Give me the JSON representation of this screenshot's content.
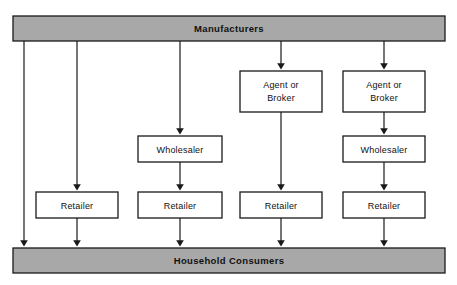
{
  "diagram": {
    "type": "flow-diagram",
    "orientation": "top-to-bottom",
    "canvas": {
      "width": 457,
      "height": 285
    },
    "colors": {
      "bar_fill": "#a8a8a8",
      "box_fill": "#ffffff",
      "stroke": "#1a1a1a",
      "background": "#ffffff"
    },
    "source": {
      "id": "manufacturers",
      "label": "Manufacturers",
      "shape": "bar",
      "x": 13,
      "y": 16,
      "width": 432,
      "height": 25
    },
    "sink": {
      "id": "household-consumers",
      "label": "Household Consumers",
      "shape": "bar",
      "x": 13,
      "y": 248,
      "width": 432,
      "height": 25
    },
    "levels": [
      {
        "id": "agent-level",
        "y": 71,
        "height": 41
      },
      {
        "id": "wholesaler-level",
        "y": 136,
        "height": 26
      },
      {
        "id": "retailer-level",
        "y": 192,
        "height": 26
      }
    ],
    "nodes": [
      {
        "id": "agent-1",
        "label": "Agent or Broker",
        "line1": "Agent or",
        "line2": "Broker",
        "x": 240,
        "y": 71,
        "width": 82,
        "height": 41
      },
      {
        "id": "agent-2",
        "label": "Agent or Broker",
        "line1": "Agent or",
        "line2": "Broker",
        "x": 343,
        "y": 71,
        "width": 82,
        "height": 41
      },
      {
        "id": "wholesaler-1",
        "label": "Wholesaler",
        "x": 138,
        "y": 136,
        "width": 84,
        "height": 26
      },
      {
        "id": "wholesaler-2",
        "label": "Wholesaler",
        "x": 343,
        "y": 136,
        "width": 82,
        "height": 26
      },
      {
        "id": "retailer-1",
        "label": "Retailer",
        "x": 36,
        "y": 192,
        "width": 82,
        "height": 26
      },
      {
        "id": "retailer-2",
        "label": "Retailer",
        "x": 138,
        "y": 192,
        "width": 84,
        "height": 26
      },
      {
        "id": "retailer-3",
        "label": "Retailer",
        "x": 240,
        "y": 192,
        "width": 82,
        "height": 26
      },
      {
        "id": "retailer-4",
        "label": "Retailer",
        "x": 343,
        "y": 192,
        "width": 82,
        "height": 26
      }
    ],
    "channels": [
      {
        "id": "channel-1",
        "name": "direct",
        "path": [
          "manufacturers",
          "household-consumers"
        ],
        "x": 24
      },
      {
        "id": "channel-2",
        "name": "retailer",
        "path": [
          "manufacturers",
          "retailer-1",
          "household-consumers"
        ],
        "x": 77
      },
      {
        "id": "channel-3",
        "name": "wholesaler-retailer",
        "path": [
          "manufacturers",
          "wholesaler-1",
          "retailer-2",
          "household-consumers"
        ],
        "x": 180
      },
      {
        "id": "channel-4",
        "name": "agent-retailer",
        "path": [
          "manufacturers",
          "agent-1",
          "retailer-3",
          "household-consumers"
        ],
        "x": 281
      },
      {
        "id": "channel-5",
        "name": "agent-wholesaler-retailer",
        "path": [
          "manufacturers",
          "agent-2",
          "wholesaler-2",
          "retailer-4",
          "household-consumers"
        ],
        "x": 384
      }
    ]
  }
}
